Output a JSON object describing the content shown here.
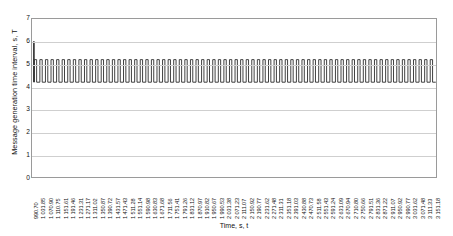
{
  "chart_data": {
    "type": "line",
    "title": "",
    "subtitle": "",
    "xlabel": "Time, s, t",
    "ylabel": "Message generation time interval, s, T",
    "ylim": [
      0,
      7
    ],
    "y_ticks": [
      0,
      1,
      2,
      3,
      4,
      5,
      6,
      7
    ],
    "grid": true,
    "legend": false,
    "legend_position": "none",
    "annotations": [],
    "series_name": "Message generation time interval",
    "series_color": "#2b2b2b",
    "waveform": {
      "initial_spike_value": 6.0,
      "low_value": 4.2,
      "high_value": 5.2,
      "cycles": 72
    },
    "categories": [
      "990.70",
      "1 031.85",
      "1 070.90",
      "1 110.75",
      "1 151.61",
      "1 191.46",
      "1 231.31",
      "1 271.17",
      "1 311.02",
      "1 350.87",
      "1 390.72",
      "1 431.57",
      "1 471.43",
      "1 511.28",
      "1 551.14",
      "1 590.98",
      "1 630.83",
      "1 671.68",
      "1 711.56",
      "1 751.41",
      "1 791.26",
      "1 831.12",
      "1 870.97",
      "1 910.82",
      "1 950.67",
      "1 990.53",
      "2 031.38",
      "2 071.23",
      "2 111.07",
      "2 150.92",
      "2 190.77",
      "2 231.62",
      "2 271.48",
      "2 311.31",
      "2 351.18",
      "2 391.03",
      "2 430.88",
      "2 470.73",
      "2 511.58",
      "2 551.43",
      "2 591.24",
      "2 631.09",
      "2 670.94",
      "2 710.80",
      "2 750.66",
      "2 791.51",
      "2 831.36",
      "2 871.22",
      "2 911.07",
      "2 950.92",
      "2 990.77",
      "3 031.62",
      "3 071.48",
      "3 111.33",
      "3 151.18"
    ],
    "x_range_first": "990.70",
    "x_range_last": "3 151.18",
    "x_tick_count": 55
  }
}
